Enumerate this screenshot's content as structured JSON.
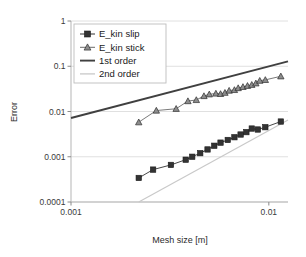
{
  "chart_data": {
    "type": "line",
    "title": "",
    "xlabel": "Mesh size [m]",
    "ylabel": "Error",
    "xscale": "log",
    "yscale": "log",
    "xlim": [
      0.001,
      0.0125
    ],
    "ylim": [
      0.0001,
      1
    ],
    "xticks": [
      0.001,
      0.01
    ],
    "xtick_labels": [
      "0.001",
      "0.01"
    ],
    "yticks": [
      0.0001,
      0.001,
      0.01,
      0.1,
      1
    ],
    "ytick_labels": [
      "0.0001",
      "0.001",
      "0.01",
      "0.1",
      "1"
    ],
    "grid": "horizontal-major",
    "legend_position": "upper-left",
    "series": [
      {
        "name": "E_kin slip",
        "marker": "square",
        "color": "#333333",
        "x": [
          0.0022,
          0.0026,
          0.0032,
          0.0038,
          0.0041,
          0.0045,
          0.0049,
          0.0053,
          0.0057,
          0.0062,
          0.0067,
          0.0072,
          0.0077,
          0.0082,
          0.0088,
          0.0096,
          0.0115
        ],
        "y": [
          0.00034,
          0.00052,
          0.00066,
          0.00086,
          0.001,
          0.0012,
          0.00145,
          0.00175,
          0.00205,
          0.00235,
          0.0027,
          0.0031,
          0.0035,
          0.0042,
          0.004,
          0.0045,
          0.006
        ]
      },
      {
        "name": "E_kin stick",
        "marker": "triangle",
        "color": "#6b6b6b",
        "x": [
          0.0022,
          0.0027,
          0.0034,
          0.0039,
          0.0043,
          0.0047,
          0.005,
          0.0054,
          0.0057,
          0.006,
          0.0063,
          0.0067,
          0.007,
          0.0074,
          0.0078,
          0.0082,
          0.0086,
          0.009,
          0.0096,
          0.0115
        ],
        "y": [
          0.0058,
          0.0105,
          0.0115,
          0.017,
          0.018,
          0.022,
          0.024,
          0.025,
          0.0245,
          0.026,
          0.029,
          0.03,
          0.033,
          0.035,
          0.037,
          0.039,
          0.042,
          0.048,
          0.05,
          0.06
        ]
      }
    ],
    "reference_lines": [
      {
        "name": "1st order",
        "slope": 1,
        "color": "#404040",
        "x": [
          0.001,
          0.0125
        ],
        "y": [
          0.0072,
          0.128
        ]
      },
      {
        "name": "2nd order",
        "slope": 2,
        "color": "#c9c9c9",
        "x": [
          0.0022,
          0.0125
        ],
        "y": [
          0.0001,
          0.0065
        ]
      }
    ]
  },
  "legend": {
    "items": [
      {
        "label": "E_kin slip",
        "marker": "square-line",
        "color": "#333333"
      },
      {
        "label": "E_kin stick",
        "marker": "triangle-line",
        "color": "#6b6b6b"
      },
      {
        "label": "1st order",
        "marker": "line",
        "color": "#404040"
      },
      {
        "label": "2nd order",
        "marker": "line",
        "color": "#c9c9c9"
      }
    ]
  },
  "axes": {
    "x_title": "Mesh size [m]",
    "y_title": "Error",
    "x_tick_labels": [
      "0.001",
      "0.01"
    ],
    "y_tick_labels": [
      "1",
      "0.1",
      "0.01",
      "0.001",
      "0.0001"
    ]
  }
}
